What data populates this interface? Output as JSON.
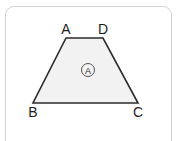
{
  "canvas": {
    "width": 180,
    "height": 141,
    "background_color": "#ffffff"
  },
  "card": {
    "name": "diagram-card",
    "border_color": "#d2d2d2",
    "background_color": "#ffffff",
    "corner_radius": 9
  },
  "figure": {
    "shape_type": "trapezoid",
    "fill_color": "#f2f2f2",
    "stroke_color": "#2b2b2b",
    "stroke_width": 1.6,
    "polygon_points": "66,38 103,38 138,103 33,103",
    "vertices": [
      {
        "id": "A",
        "label": "A",
        "x": 66,
        "y": 38,
        "label_x": 66,
        "label_y": 34,
        "label_anchor": "middle",
        "label_position": "above"
      },
      {
        "id": "D",
        "label": "D",
        "x": 103,
        "y": 38,
        "label_x": 103,
        "label_y": 34,
        "label_anchor": "middle",
        "label_position": "above"
      },
      {
        "id": "B",
        "label": "B",
        "x": 33,
        "y": 103,
        "label_x": 33,
        "label_y": 117,
        "label_anchor": "middle",
        "label_position": "below"
      },
      {
        "id": "C",
        "label": "C",
        "x": 138,
        "y": 103,
        "label_x": 138,
        "label_y": 117,
        "label_anchor": "middle",
        "label_position": "below"
      }
    ],
    "edges": [
      {
        "id": "AD",
        "from": "A",
        "to": "D",
        "role": "top-base"
      },
      {
        "id": "DC",
        "from": "D",
        "to": "C",
        "role": "right-leg"
      },
      {
        "id": "CB",
        "from": "C",
        "to": "B",
        "role": "bottom-base"
      },
      {
        "id": "BA",
        "from": "B",
        "to": "A",
        "role": "left-leg"
      }
    ],
    "area_marker": {
      "label": "A",
      "center_x": 88,
      "center_y": 70,
      "radius": 6.5,
      "circle_stroke_color": "#555555",
      "text_color": "#2b2b2b"
    }
  }
}
